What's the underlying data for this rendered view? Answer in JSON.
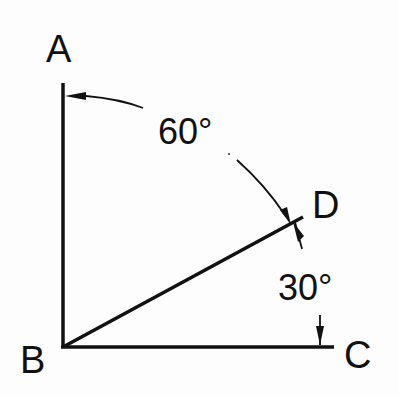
{
  "diagram": {
    "points": {
      "A": {
        "label": "A"
      },
      "B": {
        "label": "B"
      },
      "C": {
        "label": "C"
      },
      "D": {
        "label": "D"
      }
    },
    "angles": {
      "ABD": {
        "label": "60°",
        "value": 60
      },
      "DBC": {
        "label": "30°",
        "value": 30
      }
    },
    "segments": [
      "BA",
      "BC",
      "BD"
    ],
    "colors": {
      "ink": "#111111",
      "background": "#fdfdfd"
    }
  }
}
